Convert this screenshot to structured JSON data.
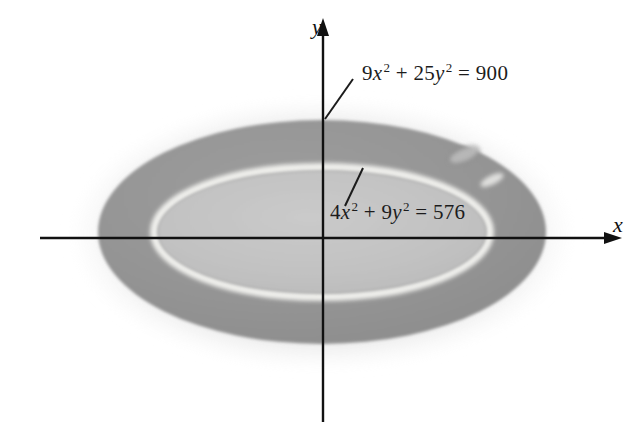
{
  "figure": {
    "kind": "coordinate-plane-annulus-diagram",
    "background_color": "#ffffff"
  },
  "axes": {
    "x_label": "x",
    "y_label": "y",
    "axis_color": "#111111",
    "origin": {
      "x": 323,
      "y": 238
    },
    "x_axis": {
      "start_x": 40,
      "end_x": 610,
      "y": 238
    },
    "y_axis": {
      "x": 323,
      "start_y": 420,
      "end_y": 26
    }
  },
  "labels": {
    "outer_curve": {
      "coefficient_x": "9",
      "var_x": "x",
      "exp_x": "2",
      "plus": " + ",
      "coefficient_y": "25",
      "var_y": "y",
      "exp_y": "2",
      "equals": " = ",
      "value": "900"
    },
    "inner_curve": {
      "coefficient_x": "4",
      "var_x": "x",
      "exp_x": "2",
      "plus": " + ",
      "coefficient_y": "9",
      "var_y": "y",
      "exp_y": "2",
      "equals": " = ",
      "value": "576"
    }
  },
  "shapes": {
    "outer_ellipse": {
      "center_x": 322,
      "center_y": 232,
      "semi_axis_x": 224,
      "semi_axis_y": 112,
      "fill_color": "#949494"
    },
    "inner_ellipse": {
      "center_x": 322,
      "center_y": 232,
      "semi_axis_x": 166,
      "semi_axis_y": 63,
      "fill_color": "#c2c2c2"
    },
    "highlight_ring": {
      "stroke_color": "#f2f2f0",
      "stroke_width": 7
    },
    "halo_color": "#d9d9d9"
  },
  "leader_lines": [
    {
      "name": "outer-leader",
      "x1": 325,
      "y1": 119,
      "x2": 353,
      "y2": 79
    },
    {
      "name": "inner-leader",
      "x1": 345,
      "y1": 206,
      "x2": 363,
      "y2": 168
    }
  ],
  "artifacts": [
    {
      "name": "scan-smudge-upper",
      "cx": 464,
      "cy": 155,
      "rx": 16,
      "ry": 7,
      "rotation": -22,
      "color": "#bdbdbd"
    },
    {
      "name": "scan-smudge-lower",
      "cx": 492,
      "cy": 180,
      "rx": 13,
      "ry": 5,
      "rotation": -26,
      "color": "#e8e8e6"
    }
  ]
}
